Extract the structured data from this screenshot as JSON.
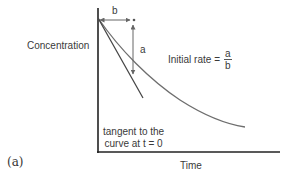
{
  "figure": {
    "panel_label": "(a)",
    "y_axis_label": "Concentration",
    "x_axis_label": "Time",
    "interval_labels": {
      "horizontal": "b",
      "vertical": "a"
    },
    "equation": {
      "prefix": "Initial rate =",
      "numerator": "a",
      "denominator": "b"
    },
    "annotation": {
      "line1": "tangent to the",
      "line2": "curve at t = 0"
    },
    "colors": {
      "axes": "#222222",
      "curve": "#6e6e6e",
      "tangent": "#444444",
      "arrows": "#666666",
      "text": "#3a3a3a"
    }
  }
}
